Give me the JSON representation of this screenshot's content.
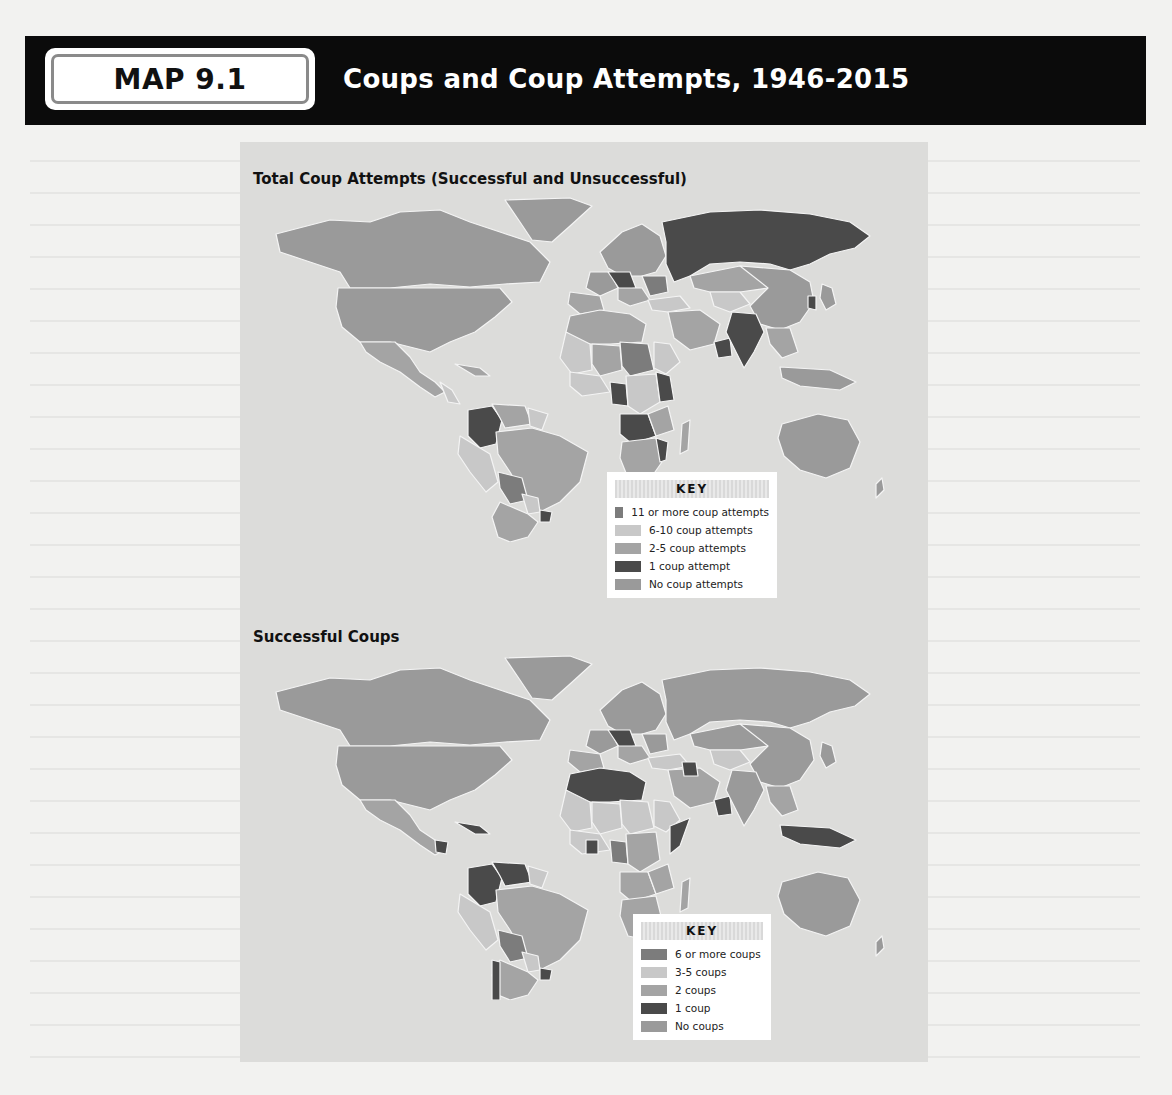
{
  "header": {
    "badge": "MAP 9.1",
    "title": "Coups and Coup Attempts, 1946-2015"
  },
  "maps": [
    {
      "title": "Total Coup Attempts (Successful and Unsuccessful)",
      "key": {
        "title": "KEY",
        "items": [
          {
            "label": "11 or more coup attempts",
            "color": "#7c7c7c"
          },
          {
            "label": "6-10 coup attempts",
            "color": "#c8c8c8"
          },
          {
            "label": "2-5 coup attempts",
            "color": "#a4a4a4"
          },
          {
            "label": "1 coup attempt",
            "color": "#4a4a4a"
          },
          {
            "label": "No coup attempts",
            "color": "#9a9a9a"
          }
        ]
      }
    },
    {
      "title": "Successful Coups",
      "key": {
        "title": "KEY",
        "items": [
          {
            "label": "6 or more coups",
            "color": "#7c7c7c"
          },
          {
            "label": "3-5 coups",
            "color": "#c8c8c8"
          },
          {
            "label": "2 coups",
            "color": "#a4a4a4"
          },
          {
            "label": "1 coup",
            "color": "#4a4a4a"
          },
          {
            "label": "No coups",
            "color": "#9a9a9a"
          }
        ]
      }
    }
  ],
  "colors": {
    "header_bg": "#0b0b0b",
    "panel_bg": "#dcdcda",
    "ocean": "#dcdcda",
    "border": "#f4f4f4"
  }
}
